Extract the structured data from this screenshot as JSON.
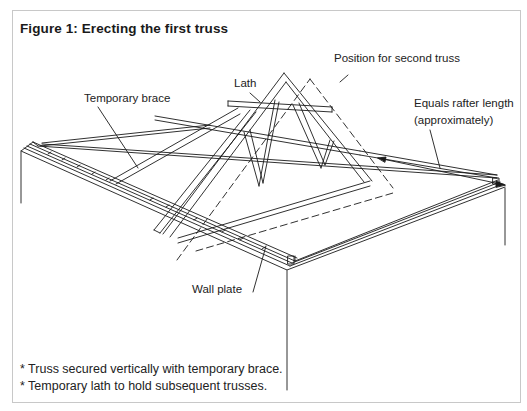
{
  "figure": {
    "title": "Figure 1: Erecting the first truss"
  },
  "labels": {
    "lath": "Lath",
    "position_second_truss": "Position for second truss",
    "temporary_brace": "Temporary brace",
    "rafter_length_line1": "Equals rafter length",
    "rafter_length_line2": "(approximately)",
    "wall_plate": "Wall plate"
  },
  "notes": [
    "* Truss secured vertically with temporary brace.",
    "* Temporary lath to hold subsequent trusses."
  ],
  "colors": {
    "line": "#1a1a1a",
    "frame_border": "#c8c8c8",
    "background": "#ffffff"
  }
}
